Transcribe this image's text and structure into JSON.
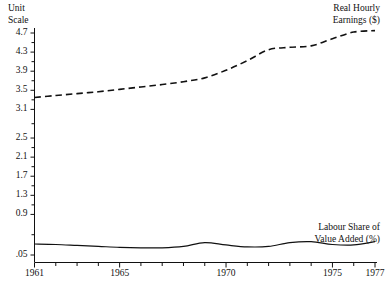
{
  "axis_header": "Unit\nScale",
  "chart_data": {
    "type": "line",
    "title": "",
    "xlabel": "",
    "ylabel": "Unit Scale",
    "grid": false,
    "legend_position": "inline-annotation",
    "xlim": [
      1961,
      1977
    ],
    "ylim": [
      0.05,
      4.9
    ],
    "y_ticks": [
      "4.7",
      "4.3",
      "3.9",
      "3.5",
      "3.1",
      "2.5",
      "2.1",
      "1.7",
      "1.3",
      "0.9",
      ".05"
    ],
    "y_tick_values": [
      4.7,
      4.3,
      3.9,
      3.5,
      3.1,
      2.5,
      2.1,
      1.7,
      1.3,
      0.9,
      0.05
    ],
    "x_ticks": [
      "1961",
      "1965",
      "1970",
      "1975",
      "1977"
    ],
    "x_tick_values": [
      1961,
      1965,
      1970,
      1975,
      1977
    ],
    "x_minor_every": 1,
    "x": [
      1961,
      1962,
      1963,
      1964,
      1965,
      1966,
      1967,
      1968,
      1969,
      1970,
      1971,
      1972,
      1973,
      1974,
      1975,
      1976,
      1977
    ],
    "series": [
      {
        "name": "Real Hourly Earnings ($)",
        "style": "dashed",
        "color": "#111111",
        "values": [
          3.35,
          3.39,
          3.43,
          3.47,
          3.52,
          3.57,
          3.62,
          3.68,
          3.76,
          3.92,
          4.12,
          4.35,
          4.4,
          4.43,
          4.58,
          4.72,
          4.75
        ]
      },
      {
        "name": "Labour Share of Value Added (%)",
        "style": "solid",
        "color": "#111111",
        "values": [
          0.28,
          0.27,
          0.25,
          0.23,
          0.21,
          0.2,
          0.2,
          0.23,
          0.31,
          0.26,
          0.22,
          0.23,
          0.31,
          0.33,
          0.27,
          0.26,
          0.33
        ]
      }
    ],
    "annotations": [
      {
        "id": "earnings",
        "text": "Real Hourly\nEarnings ($)"
      },
      {
        "id": "labour",
        "text": "Labour Share of\nValue Added (%)"
      }
    ]
  }
}
